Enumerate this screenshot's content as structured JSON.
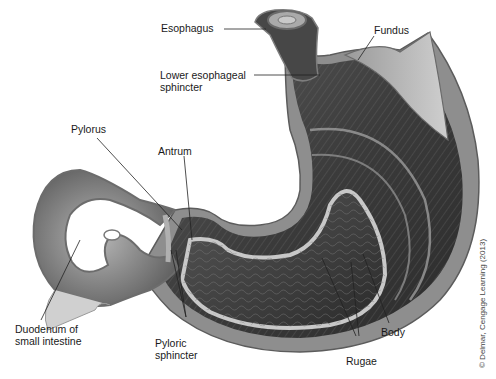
{
  "diagram": {
    "colors": {
      "background": "#ffffff",
      "muscle_dark": "#3a3a3a",
      "muscle_mid": "#6d6d6d",
      "lining_light": "#bdbdbd",
      "outer_wall": "#9a9a9a",
      "label_text": "#1a1a1a",
      "leader_line": "#222222"
    },
    "labels": {
      "esophagus": "Esophagus",
      "fundus": "Fundus",
      "lower_esophageal_sphincter": "Lower esophageal\nsphincter",
      "pylorus": "Pylorus",
      "antrum": "Antrum",
      "duodenum": "Duodenum of\nsmall intestine",
      "pyloric_sphincter": "Pyloric\nsphincter",
      "rugae": "Rugae",
      "body": "Body"
    },
    "copyright": "© Delmar, Cengage Learning (2013)"
  }
}
